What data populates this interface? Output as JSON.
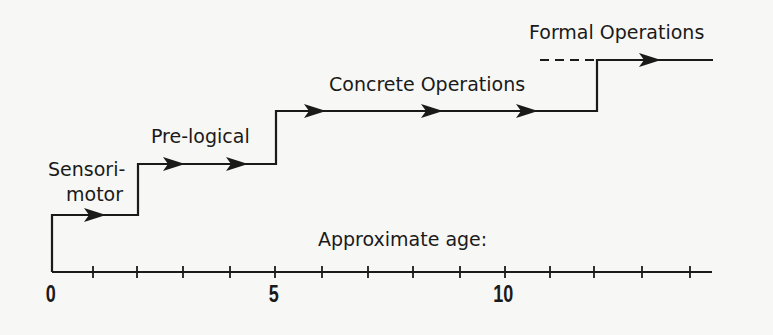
{
  "stages": [
    {
      "label_line1": "Sensori-",
      "label_line2": "motor",
      "start_age": 0,
      "end_age": 2
    },
    {
      "label": "Pre-logical",
      "start_age": 2,
      "end_age": 5
    },
    {
      "label": "Concrete Operations",
      "start_age": 5,
      "end_age": 12
    },
    {
      "label": "Formal Operations",
      "start_age": 12,
      "end_age": 14.5,
      "dashed_from_age": 10.8
    }
  ],
  "axis": {
    "label": "Approximate age:",
    "ticks": [
      0,
      1,
      2,
      3,
      4,
      5,
      6,
      7,
      8,
      9,
      10,
      11,
      12,
      13,
      14
    ],
    "tick_labels": {
      "t0": "0",
      "t5": "5",
      "t10": "10"
    }
  },
  "colors": {
    "ink": "#1a1a1a",
    "background": "#f7f7f5"
  }
}
